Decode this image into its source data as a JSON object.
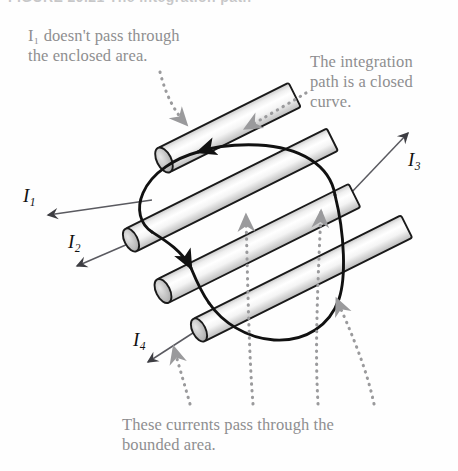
{
  "figure": {
    "cut_caption": "FIGURE 29.21   The integration path",
    "background_color": "#fefefe",
    "annotation_color": "#8e8e90",
    "wire_outline_color": "#1a1a1a",
    "wire_fill_light": "#ffffff",
    "wire_fill_shade": "#d6d6d6",
    "curve_color": "#111111",
    "leader_color": "#9a9a9c",
    "arrow_color": "#6b6b70"
  },
  "annotations": {
    "left": "I₁ doesn't pass through\nthe enclosed area.",
    "right": "The integration\npath is a closed\ncurve.",
    "bottom": "These currents pass through the\nbounded area."
  },
  "current_labels": [
    {
      "id": "I1",
      "base": "I",
      "sub": "1",
      "direction": "down-left"
    },
    {
      "id": "I2",
      "base": "I",
      "sub": "2",
      "direction": "down-left"
    },
    {
      "id": "I3",
      "base": "I",
      "sub": "3",
      "direction": "up-right"
    },
    {
      "id": "I4",
      "base": "I",
      "sub": "4",
      "direction": "down-left"
    }
  ],
  "wires": [
    {
      "name": "wire-1",
      "label": "I1",
      "encloses": false
    },
    {
      "name": "wire-2",
      "label": "I2",
      "encloses": true
    },
    {
      "name": "wire-3",
      "label": "I3",
      "encloses": true
    },
    {
      "name": "wire-4",
      "label": "I4",
      "encloses": true
    }
  ],
  "integration_path": {
    "name": "closed-curve",
    "shape": "closed bean curve",
    "orientation": "counterclockwise",
    "arrowheads": 2
  },
  "leaders": [
    {
      "name": "leader-left-to-wire1",
      "from": "left annotation",
      "to": "wire-1"
    },
    {
      "name": "leader-right-to-curve",
      "from": "right annotation",
      "to": "integration path"
    },
    {
      "name": "leader-bottom-to-wire2",
      "from": "bottom caption",
      "to": "wire-2"
    },
    {
      "name": "leader-bottom-to-wire3",
      "from": "bottom caption",
      "to": "wire-3"
    },
    {
      "name": "leader-bottom-to-wire4",
      "from": "bottom caption",
      "to": "wire-4"
    }
  ]
}
